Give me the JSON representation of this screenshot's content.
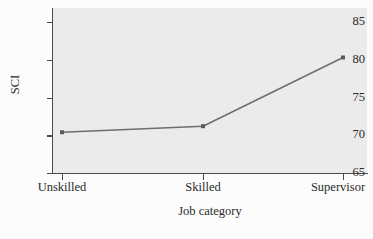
{
  "chart_data": {
    "type": "line",
    "title": "",
    "subtitle": "",
    "xlabel": "Job category",
    "ylabel": "SCI",
    "categories": [
      "Unskilled",
      "Skilled",
      "Supervisor"
    ],
    "values": [
      70.4,
      71.2,
      80.3
    ],
    "series": [
      {
        "name": "SCI",
        "values": [
          70.4,
          71.2,
          80.3
        ]
      }
    ],
    "ylim": [
      65,
      86.5
    ],
    "yticks": [
      65,
      70,
      75,
      80,
      85
    ],
    "ytick_labels": [
      "65",
      "70",
      "75",
      "80",
      "85"
    ],
    "xtick_labels": [
      "Unskilled",
      "Skilled",
      "Supervisor"
    ],
    "grid": false,
    "legend": false,
    "legend_position": "none",
    "markers": "square",
    "colors": {
      "line": "#6e6e6e",
      "marker": "#5a5a5a",
      "axis": "#4a4a4a",
      "panel_background": "#ececec",
      "figure_background": "#fcfcfc",
      "text": "#2b2b2b"
    }
  }
}
